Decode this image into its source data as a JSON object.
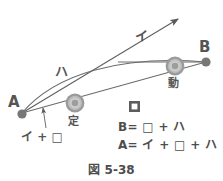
{
  "figure": {
    "caption": "図 5-38",
    "points": {
      "a_label": "A",
      "b_label": "B"
    },
    "rings": {
      "fixed_label": "定",
      "moving_label": "動"
    },
    "segments": {
      "arrow_label": "イ",
      "curve_label": "ハ",
      "square_label": "□"
    },
    "leader": {
      "label": "イ + □"
    },
    "equations": [
      "B= □ + ハ",
      "A= イ + □ + ハ"
    ],
    "colors": {
      "ink": "#4d4d4d",
      "line": "#6b6b6b",
      "ring_outer": "#9a9a9a",
      "ring_inner": "#c9c9c9",
      "dot": "#777777",
      "background": "#ffffff"
    }
  }
}
